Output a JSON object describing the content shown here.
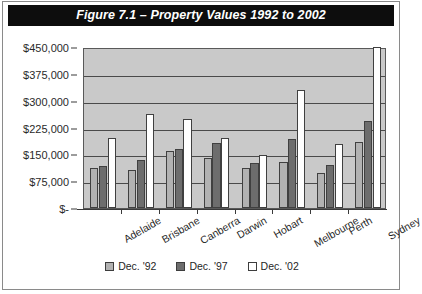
{
  "figure": {
    "title": "Figure 7.1 – Property Values 1992 to 2002"
  },
  "chart_data": {
    "type": "bar",
    "title": "Figure 7.1 – Property Values 1992 to 2002",
    "xlabel": "",
    "ylabel": "",
    "ylim": [
      0,
      450000
    ],
    "ytick_step": 75000,
    "grid": true,
    "legend_position": "bottom",
    "categories": [
      "Adelaide",
      "Brisbane",
      "Canberra",
      "Darwin",
      "Hobart",
      "Melbourne",
      "Perth",
      "Sydney"
    ],
    "ytick_labels": [
      "$450,000",
      "$375,000",
      "$300,000",
      "$225,000",
      "$150,000",
      "$75,000",
      "$-"
    ],
    "ytick_values": [
      450000,
      375000,
      300000,
      225000,
      150000,
      75000,
      0
    ],
    "series": [
      {
        "name": "Dec. '92",
        "color": "#b2b2b2",
        "values": [
          112000,
          105000,
          160000,
          140000,
          113000,
          128000,
          98000,
          185000
        ]
      },
      {
        "name": "Dec. '97",
        "color": "#6d6d6d",
        "values": [
          118000,
          135000,
          165000,
          182000,
          125000,
          193000,
          120000,
          243000
        ]
      },
      {
        "name": "Dec. '02",
        "color": "#ffffff",
        "values": [
          195000,
          262000,
          248000,
          195000,
          148000,
          330000,
          180000,
          450000
        ]
      }
    ]
  }
}
